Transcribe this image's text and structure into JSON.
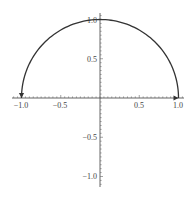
{
  "chart_data": {
    "type": "line",
    "title": "",
    "xlabel": "",
    "ylabel": "",
    "xlim": [
      -1.1,
      1.1
    ],
    "ylim": [
      -1.1,
      1.1
    ],
    "grid": false,
    "legend": null,
    "x_ticks": [
      -1.0,
      -0.5,
      0.5,
      1.0
    ],
    "x_tick_labels": [
      "−1.0",
      "−0.5",
      "0.5",
      "1.0"
    ],
    "y_ticks": [
      1.0,
      0.5,
      -0.5,
      -1.0
    ],
    "y_tick_labels": [
      "1.0",
      "0.5",
      "−0.5",
      "−1.0"
    ],
    "series": [
      {
        "name": "upper unit semicircle",
        "description": "x = cos(t), y = sin(t), t from 0 to pi",
        "x": [
          1.0,
          0.924,
          0.707,
          0.383,
          0.0,
          -0.383,
          -0.707,
          -0.924,
          -1.0
        ],
        "y": [
          0.0,
          0.383,
          0.707,
          0.924,
          1.0,
          0.924,
          0.707,
          0.383,
          0.0
        ],
        "color": "#333333",
        "arrowheads": [
          {
            "at": [
              -1.0,
              0.0
            ],
            "direction": "down"
          },
          {
            "at": [
              1.0,
              0.0
            ],
            "direction": "right"
          }
        ]
      }
    ],
    "colors": {
      "axis": "#555555",
      "curve": "#333333",
      "text": "#444444"
    }
  }
}
